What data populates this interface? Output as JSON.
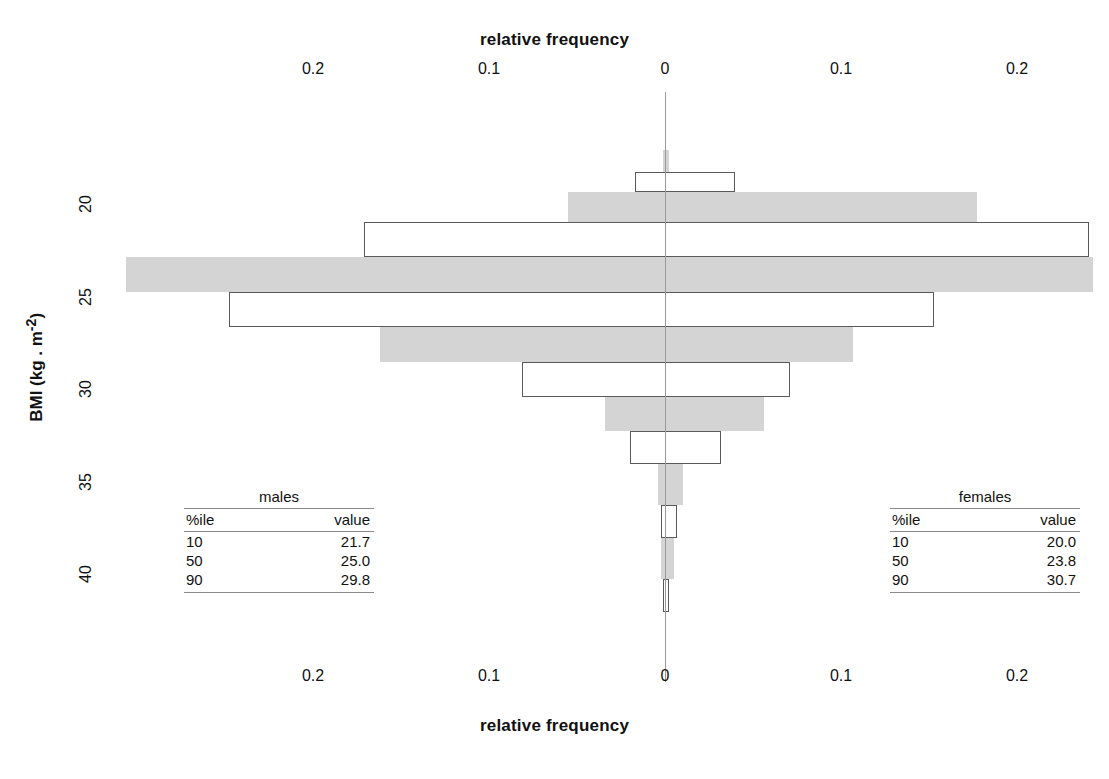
{
  "axes": {
    "top_title": "relative frequency",
    "bottom_title": "relative frequency",
    "y_title": "BMI (kg . m-2)",
    "y_title_base": "BMI (kg . m",
    "y_title_sup": "-2",
    "y_title_close": ")",
    "x_ticks": [
      "0.2",
      "0.1",
      "0",
      "0.1",
      "0.2"
    ],
    "y_ticks": [
      "20",
      "25",
      "30",
      "35",
      "40"
    ]
  },
  "tables": {
    "males": {
      "title": "males",
      "headers": [
        "%ile",
        "value"
      ],
      "rows": [
        {
          "pct": "10",
          "value": "21.7"
        },
        {
          "pct": "50",
          "value": "25.0"
        },
        {
          "pct": "90",
          "value": "29.8"
        }
      ]
    },
    "females": {
      "title": "females",
      "headers": [
        "%ile",
        "value"
      ],
      "rows": [
        {
          "pct": "10",
          "value": "20.0"
        },
        {
          "pct": "50",
          "value": "23.8"
        },
        {
          "pct": "90",
          "value": "30.7"
        }
      ]
    }
  },
  "colors": {
    "gray_bar": "#d4d4d4",
    "white_bar_border": "#5a5a5a",
    "zero_line": "#9a9a9a",
    "text": "#111111"
  },
  "chart_data": {
    "type": "bar",
    "subtype": "back-to-back bi-directional histogram (population pyramid)",
    "title": "relative frequency",
    "xlabel": "relative frequency",
    "ylabel": "BMI (kg . m-2)",
    "xlim": [
      -0.24,
      0.24
    ],
    "xtick_values": [
      -0.2,
      -0.1,
      0,
      0.1,
      0.2
    ],
    "xtick_labels": [
      "0.2",
      "0.1",
      "0",
      "0.1",
      "0.2"
    ],
    "ylim": [
      17.0,
      40.5
    ],
    "ytick_values": [
      20,
      25,
      30,
      35,
      40
    ],
    "y_inverted": true,
    "grid": false,
    "legend": "none",
    "series": [
      {
        "name": "males",
        "direction": "left"
      },
      {
        "name": "females",
        "direction": "right"
      }
    ],
    "bins": [
      {
        "bmi_low": 17.0,
        "bmi_high": 18.2,
        "fill": "gray",
        "males": 0.001,
        "females": 0.002
      },
      {
        "bmi_low": 18.2,
        "bmi_high": 19.3,
        "fill": "white",
        "males": 0.017,
        "females": 0.04
      },
      {
        "bmi_low": 19.3,
        "bmi_high": 20.9,
        "fill": "gray",
        "males": 0.055,
        "females": 0.177
      },
      {
        "bmi_low": 20.9,
        "bmi_high": 22.8,
        "fill": "white",
        "males": 0.171,
        "females": 0.241
      },
      {
        "bmi_low": 22.8,
        "bmi_high": 24.7,
        "fill": "gray",
        "males": 0.306,
        "females": 0.243
      },
      {
        "bmi_low": 24.7,
        "bmi_high": 26.6,
        "fill": "white",
        "males": 0.248,
        "females": 0.153
      },
      {
        "bmi_low": 26.6,
        "bmi_high": 28.5,
        "fill": "gray",
        "males": 0.162,
        "females": 0.107
      },
      {
        "bmi_low": 28.5,
        "bmi_high": 30.4,
        "fill": "white",
        "males": 0.081,
        "females": 0.071
      },
      {
        "bmi_low": 30.4,
        "bmi_high": 32.2,
        "fill": "gray",
        "males": 0.034,
        "females": 0.056
      },
      {
        "bmi_low": 32.2,
        "bmi_high": 34.0,
        "fill": "white",
        "males": 0.02,
        "females": 0.032
      },
      {
        "bmi_low": 34.0,
        "bmi_high": 36.2,
        "fill": "gray",
        "males": 0.004,
        "females": 0.01
      },
      {
        "bmi_low": 36.2,
        "bmi_high": 38.0,
        "fill": "white",
        "males": 0.002,
        "females": 0.007
      },
      {
        "bmi_low": 38.0,
        "bmi_high": 40.2,
        "fill": "gray",
        "males": 0.002,
        "females": 0.005
      },
      {
        "bmi_low": 40.2,
        "bmi_high": 42.0,
        "fill": "white",
        "males": 0.001,
        "females": 0.002
      }
    ],
    "annotations": {
      "males_percentiles": {
        "10": 21.7,
        "50": 25.0,
        "90": 29.8
      },
      "females_percentiles": {
        "10": 20.0,
        "50": 23.8,
        "90": 30.7
      }
    }
  }
}
